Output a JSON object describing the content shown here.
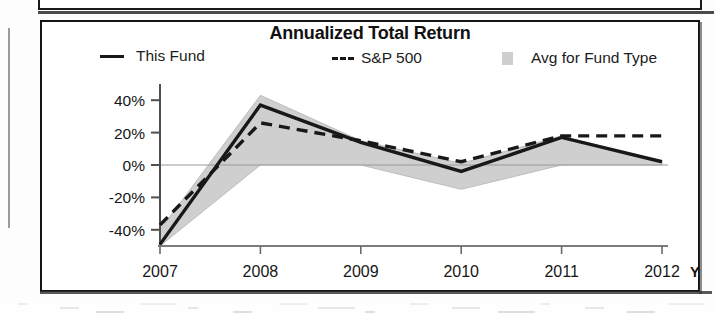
{
  "chart_data": {
    "type": "line",
    "title": "Annualized Total Return",
    "xlabel": "",
    "ylabel": "",
    "ylim": [
      -50,
      50
    ],
    "grid": false,
    "zero_line": true,
    "legend_position": "top",
    "x": [
      "2007",
      "2008",
      "2009",
      "2010",
      "2011",
      "2012"
    ],
    "x_suffix_label": "YTD",
    "categories": [
      "2007",
      "2008",
      "2009",
      "2010",
      "2011",
      "2012"
    ],
    "ytick_labels": [
      "40%",
      "20%",
      "0%",
      "-20%",
      "-40%"
    ],
    "ytick_values": [
      40,
      20,
      0,
      -20,
      -40
    ],
    "series": [
      {
        "name": "This Fund",
        "style": "solid",
        "color": "#181818",
        "values": [
          -49,
          37,
          14,
          -4,
          17,
          2
        ]
      },
      {
        "name": "S&P 500",
        "style": "dashed",
        "color": "#181818",
        "values": [
          -37,
          26,
          15,
          2,
          18,
          18
        ]
      },
      {
        "name": "Avg for Fund Type",
        "style": "area",
        "color": "#cfcfcf",
        "band_upper": [
          -40,
          43,
          15,
          1,
          18,
          2
        ],
        "band_lower": [
          -50,
          0,
          0,
          -15,
          0,
          0
        ]
      }
    ],
    "annotations": []
  },
  "chart": {
    "title": "Annualized Total Return",
    "legend": [
      {
        "label": "This Fund",
        "marker": "solid-line-swatch"
      },
      {
        "label": "S&P 500",
        "marker": "dashed-line-swatch"
      },
      {
        "label": "Avg for Fund Type",
        "marker": "area-swatch"
      }
    ],
    "y_axis": {
      "ticks": [
        "40%",
        "20%",
        "0%",
        "-20%",
        "-40%"
      ]
    },
    "x_axis": {
      "ticks": [
        "2007",
        "2008",
        "2009",
        "2010",
        "2011",
        "2012"
      ],
      "suffix": "YTD"
    },
    "colors": {
      "line": "#181818",
      "area": "#cfcfcf",
      "frame": "#141414",
      "text": "#161616"
    }
  }
}
